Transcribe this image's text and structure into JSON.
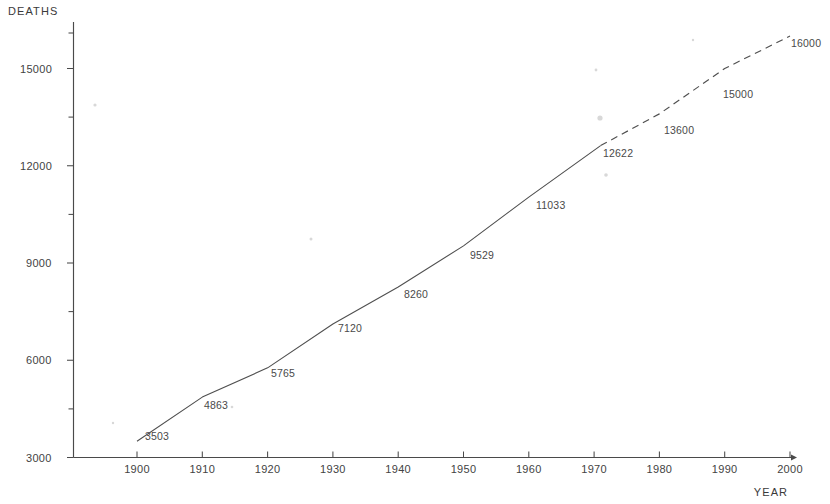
{
  "chart_data": {
    "type": "line",
    "title": "",
    "xlabel": "YEAR",
    "ylabel": "DEATHS",
    "xlim": [
      1895,
      2000
    ],
    "ylim": [
      3000,
      16500
    ],
    "grid": false,
    "legend": "none",
    "x_ticks": [
      "1900",
      "1910",
      "1920",
      "1930",
      "1940",
      "1950",
      "1960",
      "1970",
      "1980",
      "1990",
      "2000"
    ],
    "y_ticks": [
      "3000",
      "6000",
      "9000",
      "12000",
      "15000"
    ],
    "y_minor_ticks": [
      4500,
      7500,
      10500,
      13500,
      16500
    ],
    "series": [
      {
        "name": "Observed deaths",
        "style": "solid",
        "x": [
          1900,
          1910,
          1920,
          1930,
          1940,
          1950,
          1960,
          1971
        ],
        "values": [
          3503,
          4863,
          5765,
          7120,
          8260,
          9529,
          11033,
          12622
        ],
        "point_labels": [
          "3503",
          "4863",
          "5765",
          "7120",
          "8260",
          "9529",
          "11033",
          "12622"
        ]
      },
      {
        "name": "Projected deaths",
        "style": "dashed",
        "x": [
          1971,
          1980,
          1990,
          2000
        ],
        "values": [
          12622,
          13600,
          15000,
          16000
        ],
        "point_labels": [
          "",
          "13600",
          "15000",
          "16000"
        ]
      }
    ],
    "annotations": []
  },
  "colors": {
    "background": "#ffffff",
    "axis": "#4a4a4a",
    "series_line": "#4f4f4f",
    "text": "#434343"
  }
}
